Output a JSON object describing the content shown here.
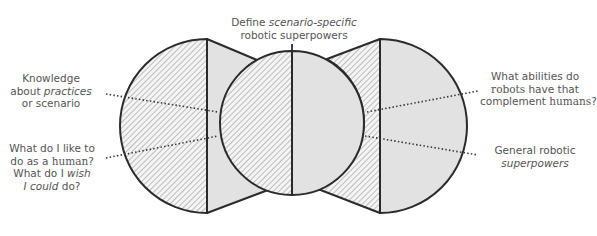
{
  "diagram": {
    "title_label": {
      "line1_prefix": "Define ",
      "line1_italic": "scenario-specific",
      "line2": "robotic superpowers"
    },
    "left_labels": [
      {
        "id": "knowledge",
        "line1": "Knowledge",
        "line2_prefix": "about ",
        "line2_italic": "practices",
        "line3": "or scenario"
      },
      {
        "id": "human-wishes",
        "line1": "What do I like to",
        "line2_prefix": "do as a ",
        "line2_serif": "human",
        "line2_suffix": "?",
        "line3_prefix": "What do I ",
        "line3_italic": "wish",
        "line4_italic": "I could",
        "line4_suffix": " do?"
      }
    ],
    "right_labels": [
      {
        "id": "robot-abilities",
        "line1": "What abilities do",
        "line2_serif": "robots",
        "line2_suffix": " have that",
        "line3_prefix": "complement ",
        "line3_serif": "humans",
        "line3_suffix": "?"
      },
      {
        "id": "general-superpowers",
        "line1": "General robotic",
        "line2_italic": "superpowers"
      }
    ],
    "colors": {
      "stroke": "#2b2b2b",
      "gray_fill": "#e2e2e2",
      "hatch": "#9a9a9a",
      "text": "#555555",
      "dots": "#3a3a3a"
    },
    "shapes": {
      "left_circle": {
        "cx": 207,
        "cy": 126,
        "r": 87,
        "hatched_half": "left"
      },
      "center_circle": {
        "cx": 292,
        "cy": 122,
        "r": 72,
        "hatched_half": "left",
        "gray_half": "right"
      },
      "right_circle": {
        "cx": 380,
        "cy": 126,
        "r": 87,
        "gray_half": "right"
      },
      "left_wedge": {
        "fill": "gray"
      },
      "right_wedge": {
        "fill": "hatched"
      }
    }
  }
}
